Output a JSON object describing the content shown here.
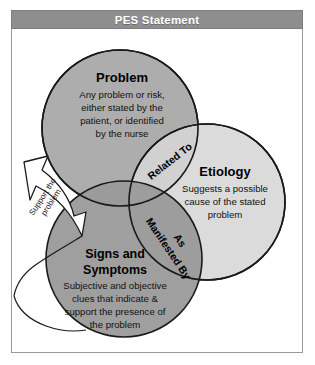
{
  "header": {
    "title": "PES Statement"
  },
  "colors": {
    "problem_fill": "#adadad",
    "etiology_fill": "#d6d6d6",
    "signs_fill": "#9a9a9a",
    "circle_stroke": "#1a1a1a",
    "header_bg": "#8e8e8e",
    "header_text": "#ffffff",
    "frame_border": "#9a9a9a",
    "arrow_fill": "#ffffff",
    "arrow_stroke": "#1a1a1a"
  },
  "circles": {
    "problem": {
      "title": "Problem",
      "body": [
        "Any problem or risk,",
        "either stated by the",
        "patient, or identified",
        "by the nurse"
      ]
    },
    "etiology": {
      "title": "Etiology",
      "body": [
        "Suggests a possible",
        "cause of the stated",
        "problem"
      ]
    },
    "signs": {
      "title_line1": "Signs and",
      "title_line2": "Symptoms",
      "body": [
        "Subjective and objective",
        "clues that indicate &",
        "support the presence of",
        "the problem"
      ]
    }
  },
  "overlaps": {
    "problem_etiology": {
      "label": "Related To"
    },
    "signs_etiology": {
      "label_line1": "As",
      "label_line2": "Manifested By"
    }
  },
  "arrow": {
    "label_line1": "Support the",
    "label_line2": "problem"
  }
}
